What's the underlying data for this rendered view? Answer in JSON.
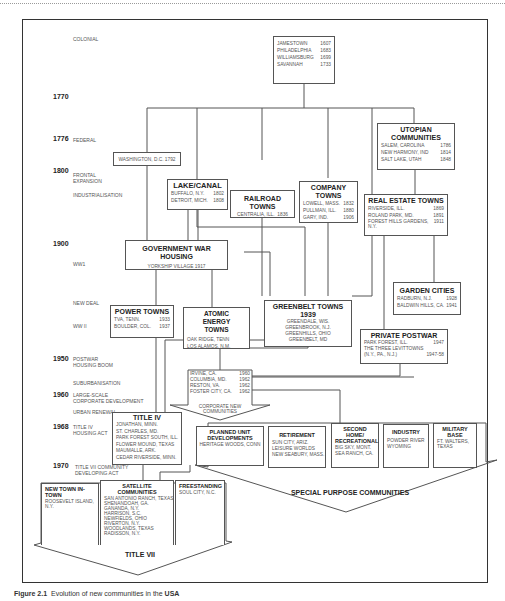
{
  "caption": {
    "prefix": "Figure 2.1",
    "text": "Evolution of new communities in the",
    "bold": "USA"
  },
  "timeline": {
    "colonial": "COLONIAL",
    "y1770": "1770",
    "y1776": "1776",
    "federal": "FEDERAL",
    "y1800": "1800",
    "frontal": "FRONTAL\nEXPANSION",
    "industrial": "INDUSTRIALISATION",
    "y1900": "1900",
    "ww1": "WW1",
    "newdeal": "NEW DEAL",
    "ww2": "WW II",
    "y1950": "1950",
    "postwar": "POSTWAR\nHOUSING BOOM",
    "suburb": "SUBURBANISATION",
    "y1960": "1960",
    "largescale": "LARGE-SCALE\nCORPORATE DEVELOPMENT",
    "urban": "URBAN RENEWAL",
    "y1968": "1968",
    "titleiv": "TITLE IV\nHOUSING ACT",
    "y1970": "1970",
    "titlevii": "TITLE VII COMMUNITY\nDEVELOPING ACT"
  },
  "boxes": {
    "colonial": {
      "rows": [
        [
          "JAMESTOWN",
          "1607"
        ],
        [
          "PHILADELPHIA",
          "1683"
        ],
        [
          "WILLIAMSBURG",
          "1699"
        ],
        [
          "SAVANNAH",
          "1733"
        ]
      ]
    },
    "washington": {
      "text": "WASHINGTON, D.C. 1792"
    },
    "utopian": {
      "title": "UTOPIAN COMMUNITIES",
      "rows": [
        [
          "SALEM, CAROLINA",
          "1786"
        ],
        [
          "NEW HARMONY, IND",
          "1814"
        ],
        [
          "SALT LAKE, UTAH",
          "1848"
        ]
      ]
    },
    "lake": {
      "title": "LAKE/CANAL",
      "rows": [
        [
          "BUFFALO, N.Y.",
          "1802"
        ],
        [
          "DETROIT, MICH.",
          "1808"
        ]
      ]
    },
    "railroad": {
      "title": "RAILROAD TOWNS",
      "rows": [
        [
          "CENTRALIA, ILL.",
          "1836"
        ]
      ]
    },
    "company": {
      "title": "COMPANY TOWNS",
      "rows": [
        [
          "LOWELL, MASS.",
          "1832"
        ],
        [
          "PULLMAN, ILL.",
          "1880"
        ],
        [
          "GARY, IND.",
          "1906"
        ]
      ]
    },
    "realestate": {
      "title": "REAL ESTATE TOWNS",
      "rows": [
        [
          "RIVERSIDE, ILL.",
          "1869"
        ],
        [
          "ROLAND PARK, MD.",
          "1891"
        ],
        [
          "FOREST HILLS GARDENS,",
          "1911"
        ],
        [
          "N.Y.",
          ""
        ]
      ]
    },
    "govwar": {
      "title": "GOVERNMENT WAR HOUSING",
      "rows": [
        [
          "YORKSHIP VILLAGE 1917"
        ]
      ]
    },
    "power": {
      "title": "POWER TOWNS",
      "rows": [
        [
          "TVA, TENN.",
          "1933"
        ],
        [
          "BOULDER, COL.",
          "1937"
        ]
      ]
    },
    "atomic": {
      "title": "ATOMIC ENERGY TOWNS",
      "rows": [
        [
          "OAK RIDGE, TENN"
        ],
        [
          "LOS ALAMOS, N.M."
        ]
      ]
    },
    "greenbelt": {
      "title": "GREENBELT TOWNS 1939",
      "rows": [
        [
          "GREENDALE, WIS."
        ],
        [
          "GREENBROOK, N.J."
        ],
        [
          "GREENHILLS, OHIO"
        ],
        [
          "GREENBELT, MD"
        ]
      ]
    },
    "garden": {
      "title": "GARDEN CITIES",
      "rows": [
        [
          "RADBURN, N.J.",
          "1928"
        ],
        [
          "BALDWIN HILLS, CA.",
          "1941"
        ]
      ]
    },
    "private": {
      "title": "PRIVATE POSTWAR",
      "rows": [
        [
          "PARK FOREST, ILL.",
          "1947"
        ],
        [
          "THE THREE LEVITTOWNS",
          ""
        ],
        [
          "(N.Y., PA., N.J.)",
          "1947-58"
        ]
      ]
    },
    "corporate": {
      "rows": [
        [
          "IRVINE, CA.",
          "1960"
        ],
        [
          "COLUMBIA, MD.",
          "1962"
        ],
        [
          "RESTON, VA.",
          "1962"
        ],
        [
          "FOSTER CITY, CA.",
          "1962"
        ]
      ],
      "label": "CORPORATE NEW COMMUNITIES"
    },
    "title4": {
      "title": "TITLE IV",
      "rows": [
        [
          "JONATHAN, MINN."
        ],
        [
          "ST. CHARLES, MD."
        ],
        [
          "PARK FOREST SOUTH, ILL."
        ],
        [
          "FLOWER MOUND, TEXAS"
        ],
        [
          "MAUMALLE, ARK."
        ],
        [
          "CEDAR RIVERSIDE, MINN."
        ]
      ]
    },
    "pud": {
      "title": "PLANNED UNIT DEVELOPMENTS",
      "rows": [
        [
          "HERITAGE WOODS, CONN"
        ]
      ]
    },
    "retirement": {
      "title": "RETIREMENT",
      "rows": [
        [
          "SUN CITY, ARIZ."
        ],
        [
          "LEISURE WORLDS"
        ],
        [
          "NEW SEABURY, MASS."
        ]
      ]
    },
    "secondhome": {
      "title": "SECOND HOME/ RECREATIONAL",
      "rows": [
        [
          "BIG SKY, MONT."
        ],
        [
          "SEA RANCH, CA."
        ]
      ]
    },
    "industry": {
      "title": "INDUSTRY",
      "rows": [
        [
          "POWDER RIVER"
        ],
        [
          "WYOMING"
        ]
      ]
    },
    "military": {
      "title": "MILITARY BASE",
      "rows": [
        [
          "FT. WALTERS,"
        ],
        [
          "TEXAS"
        ]
      ]
    },
    "special": {
      "label": "SPECIAL PURPOSE COMMUNITIES"
    },
    "newtown": {
      "title": "NEW TOWN IN-TOWN",
      "rows": [
        [
          "ROOSEVELT ISLAND,"
        ],
        [
          "N.Y."
        ]
      ]
    },
    "satellite": {
      "title": "SATELLITE COMMUNITIES",
      "rows": [
        [
          "SAN ANTONIO RANCH, TEXAS"
        ],
        [
          "SHENANDOAH, GA."
        ],
        [
          "GANANDA, N.Y."
        ],
        [
          "HARRISON, S.C."
        ],
        [
          "NEWFIELDS, OHIO"
        ],
        [
          "RIVERTON, N.Y."
        ],
        [
          "WOODLANDS, TEXAS"
        ],
        [
          "RADISSON, N.Y."
        ]
      ]
    },
    "freestanding": {
      "title": "FREESTANDING",
      "rows": [
        [
          "SOUL CITY, N.C."
        ]
      ]
    },
    "title7": {
      "label": "TITLE VII"
    }
  }
}
